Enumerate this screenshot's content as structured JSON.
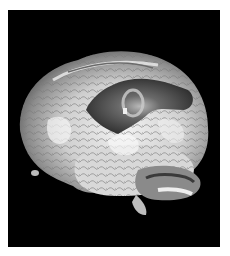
{
  "figure": {
    "colors": {
      "background": "#000000",
      "border": "#ffffff",
      "cortex_light": "#e8e8e8",
      "cortex_mid": "#9a9a9a",
      "activation_dark": "#3a3a3a"
    }
  }
}
